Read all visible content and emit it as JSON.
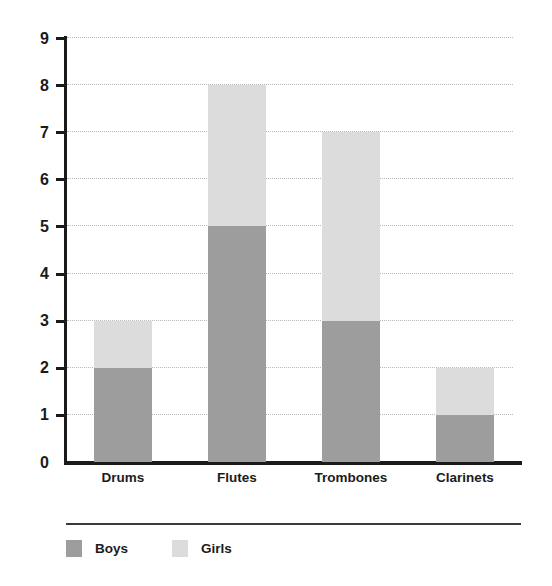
{
  "chart_data": {
    "type": "bar",
    "subtype": "stacked-bar",
    "title": "",
    "subtitle": "",
    "xlabel": "",
    "ylabel": "",
    "categories": [
      "Drums",
      "Flutes",
      "Trombones",
      "Clarinets"
    ],
    "series": [
      {
        "name": "Boys",
        "values": [
          2,
          5,
          3,
          1
        ],
        "color": "#9d9d9d"
      },
      {
        "name": "Girls",
        "values": [
          1,
          3,
          4,
          1
        ],
        "color": "#dcdcdc"
      }
    ],
    "totals": [
      3,
      8,
      7,
      2
    ],
    "ylim": [
      0,
      9
    ],
    "ytick_labels": [
      "0",
      "1",
      "2",
      "3",
      "4",
      "5",
      "6",
      "7",
      "8",
      "9"
    ],
    "ytick_values": [
      0,
      1,
      2,
      3,
      4,
      5,
      6,
      7,
      8,
      9
    ],
    "grid": true,
    "grid_style": "dotted",
    "grid_axis": "y",
    "legend_position": "bottom"
  },
  "axis": {
    "line_color": "#1a1a1a",
    "grid_color": "#b9b9b9"
  },
  "legend": {
    "entries": [
      {
        "label": "Boys",
        "color": "#9d9d9d"
      },
      {
        "label": "Girls",
        "color": "#dcdcdc"
      }
    ]
  }
}
